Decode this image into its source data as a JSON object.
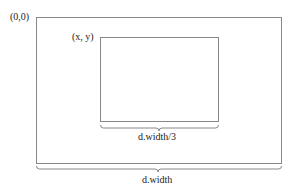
{
  "diagram": {
    "origin_label": "(0,0)",
    "inner_origin_label": "(x, y)",
    "inner_width_label": "d.width/3",
    "outer_width_label": "d.width",
    "stroke_color": "#808080"
  }
}
